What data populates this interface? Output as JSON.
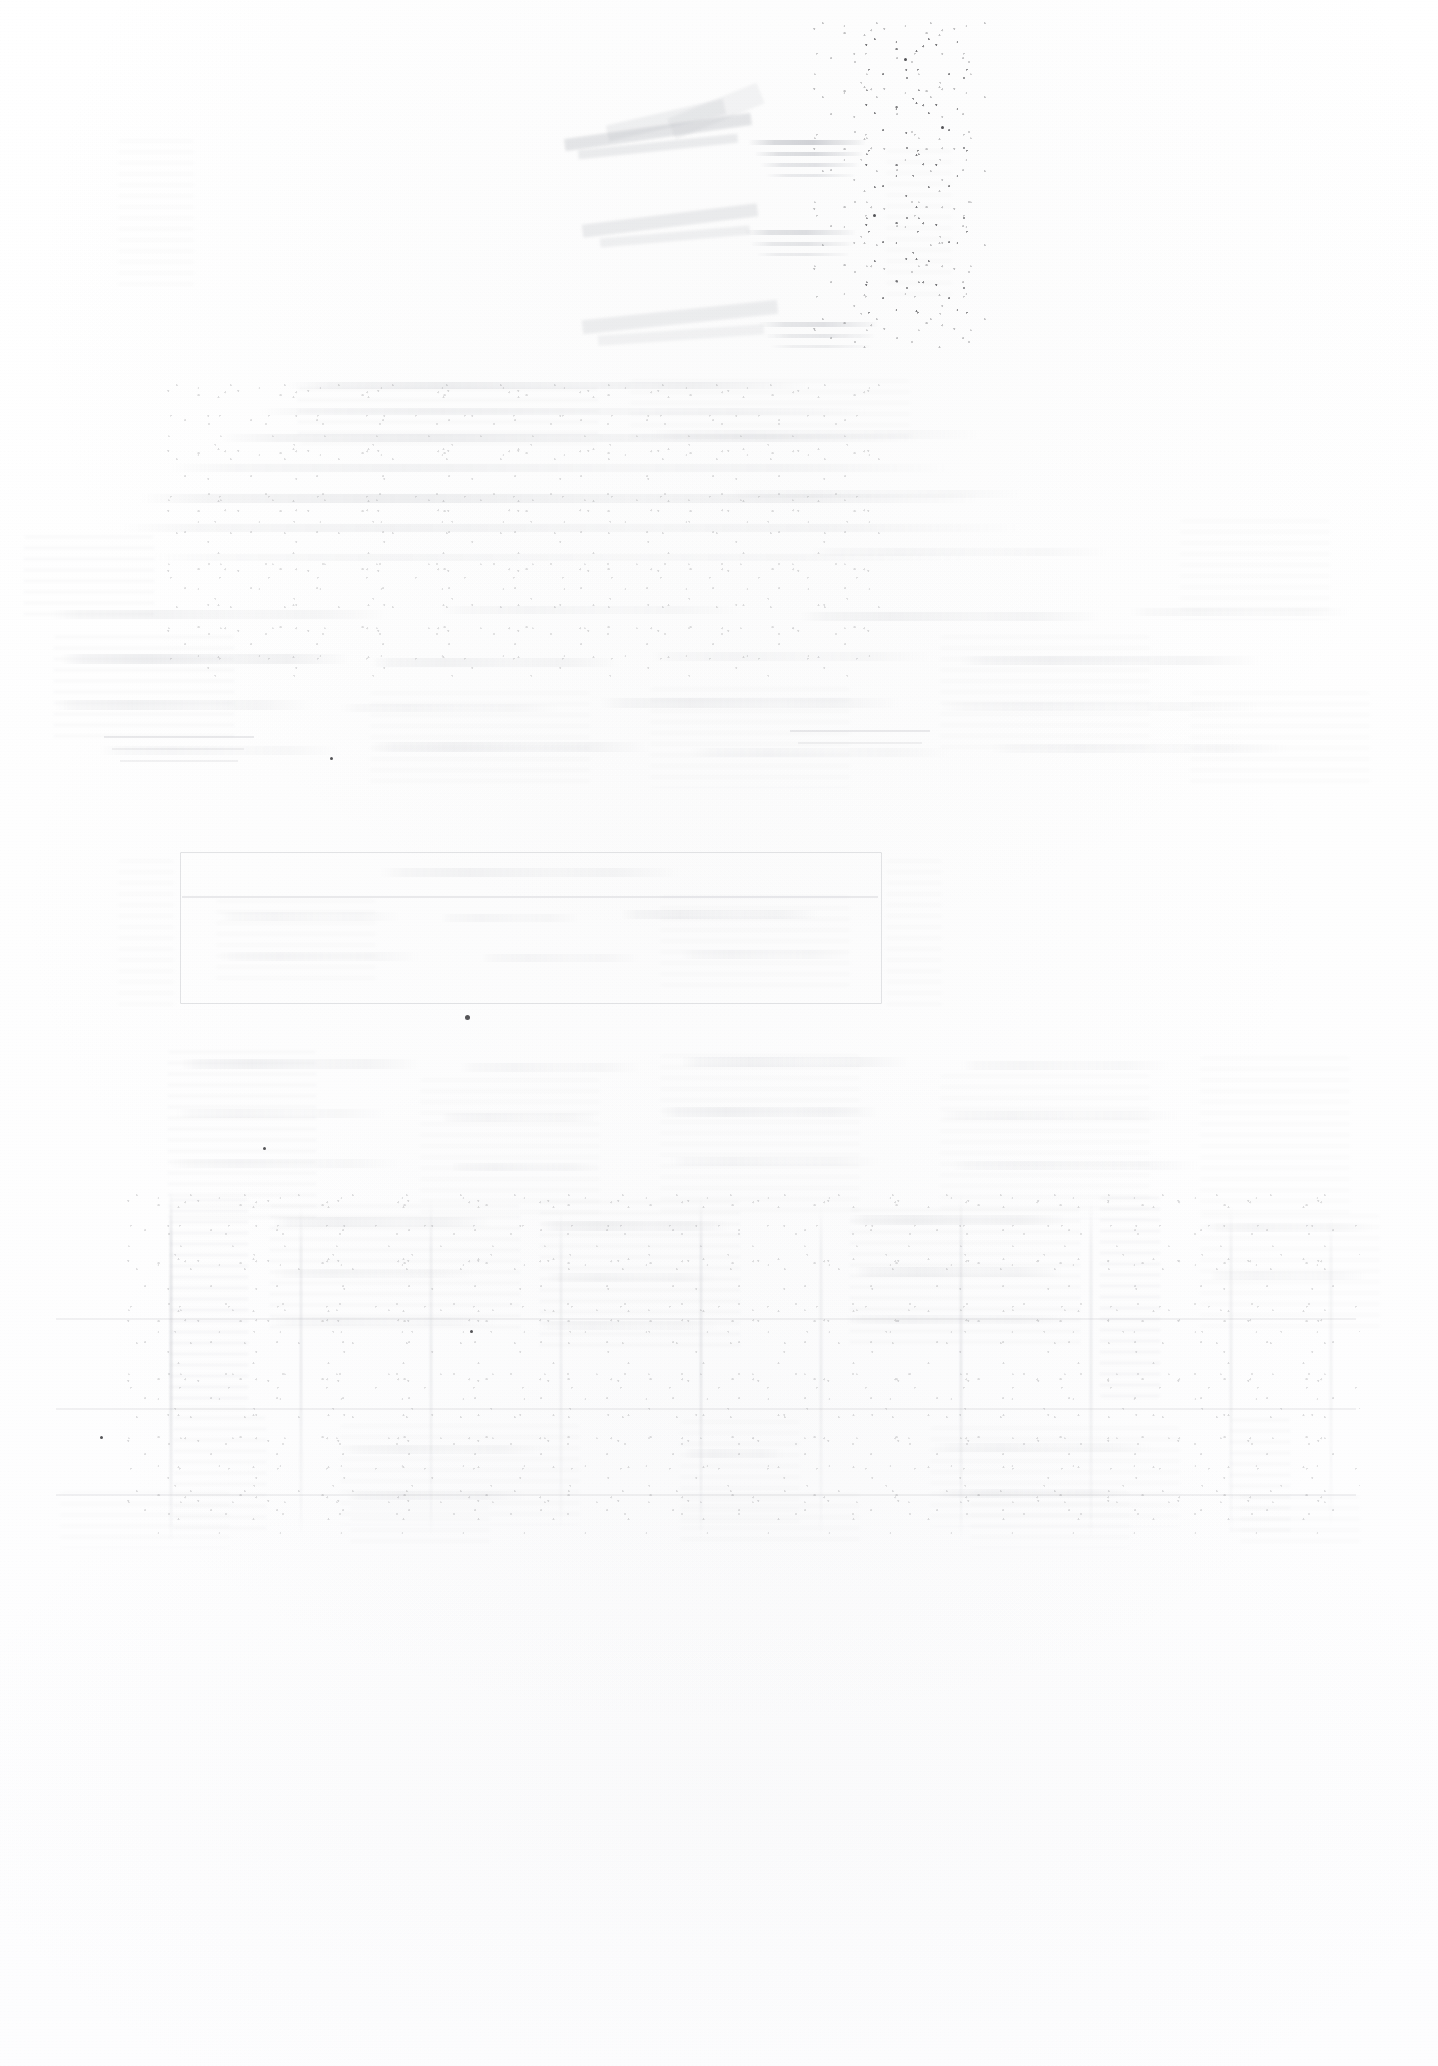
{
  "document": {
    "kind": "scanned-page",
    "condition": "severely faded / washed out",
    "legible_text": "",
    "page_width": 1438,
    "page_height": 2066,
    "background_color": "#ffffff",
    "ink_tone": "#a8abb2",
    "note_illegible": "No text in this scan is legible at any magnification; only faint ghost structures of the original layout remain."
  },
  "regions": [
    {
      "id": "masthead",
      "name": "masthead-ghost",
      "label": "",
      "x": 560,
      "y": 100,
      "w": 330,
      "h": 200,
      "description": "faint angular banded marks with short ruled strokes, upper right"
    },
    {
      "id": "masthead-secondary",
      "name": "masthead-secondary-ghost",
      "label": "",
      "x": 590,
      "y": 300,
      "w": 290,
      "h": 120,
      "description": "second angular banded cluster below masthead"
    },
    {
      "id": "body-upper",
      "name": "body-text-ghost-upper",
      "label": "",
      "x": 120,
      "y": 380,
      "w": 1180,
      "h": 280,
      "description": "diffuse horizontal smudge bands suggesting paragraph lines"
    },
    {
      "id": "body-mid",
      "name": "body-text-ghost-mid",
      "label": "",
      "x": 60,
      "y": 600,
      "w": 1300,
      "h": 230,
      "description": "broad washed paragraph mass spanning full width"
    },
    {
      "id": "boxed-insert",
      "name": "boxed-insert-frame",
      "label": "",
      "x": 180,
      "y": 852,
      "w": 700,
      "h": 150,
      "description": "faint rectangular framed box, table or boxed insert"
    },
    {
      "id": "table-upper",
      "name": "table-region-upper",
      "label": "",
      "x": 120,
      "y": 1045,
      "w": 1240,
      "h": 190,
      "description": "column blocks with vertical separators"
    },
    {
      "id": "table-lower",
      "name": "table-region-lower",
      "label": "",
      "x": 40,
      "y": 1200,
      "w": 1360,
      "h": 340,
      "description": "multi-column table region, strongest remaining contrast"
    }
  ],
  "columns": {
    "name": "table-column-separators",
    "positions": [
      170,
      300,
      430,
      560,
      700,
      820,
      960,
      1090,
      1230,
      1330
    ]
  },
  "artifacts": {
    "speckle_field": {
      "name": "scanner-speckle-field",
      "x": 860,
      "y": 35,
      "w": 110,
      "h": 280,
      "label": "ink specks / scanner noise"
    },
    "flecks": [
      {
        "name": "ink-fleck",
        "x": 466,
        "y": 1016,
        "r": 3
      },
      {
        "name": "ink-fleck",
        "x": 331,
        "y": 758,
        "r": 2
      },
      {
        "name": "ink-fleck",
        "x": 471,
        "y": 1331,
        "r": 2
      },
      {
        "name": "ink-fleck",
        "x": 264,
        "y": 1148,
        "r": 2
      },
      {
        "name": "ink-fleck",
        "x": 101,
        "y": 1437,
        "r": 2
      }
    ]
  }
}
